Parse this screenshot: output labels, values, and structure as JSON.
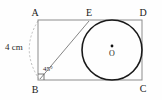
{
  "figure": {
    "background_color": "#fefefe",
    "rectangle": {
      "stroke_color": "#8c8c8c",
      "stroke_width": 1,
      "x": 38,
      "y": 20,
      "width": 104,
      "height": 60
    },
    "circle": {
      "stroke_color": "#1a1a1a",
      "stroke_width": 1.6,
      "fill": "none",
      "cx": 112,
      "cy": 50,
      "r": 30
    },
    "center_dot": {
      "cx": 112,
      "cy": 46,
      "r": 1.4,
      "color": "#111111"
    },
    "diagonal_line": {
      "stroke_color": "#777777",
      "stroke_width": 0.9,
      "x1": 40,
      "y1": 79,
      "x2": 89,
      "y2": 21
    },
    "dashed_arc": {
      "stroke_color": "#b4b4b4",
      "stroke_width": 0.9,
      "dash": "2,2",
      "from_x": 38,
      "from_y": 21,
      "to_x": 39,
      "to_y": 79,
      "bulge_x": 20,
      "bulge_y": 50
    },
    "right_angle_marker": {
      "stroke_color": "#555555",
      "size": 6
    },
    "labels": {
      "vertex_a": "A",
      "vertex_b": "B",
      "vertex_c": "C",
      "vertex_d": "D",
      "vertex_e": "E",
      "center_o": "O",
      "side_measure": "4 cm",
      "angle_measure": "45°"
    },
    "label_positions": {
      "vertex_a": {
        "x": 35,
        "y": 16
      },
      "vertex_b": {
        "x": 35,
        "y": 93
      },
      "vertex_c": {
        "x": 143,
        "y": 92
      },
      "vertex_d": {
        "x": 143,
        "y": 16
      },
      "vertex_e": {
        "x": 89,
        "y": 16
      },
      "center_o": {
        "x": 112,
        "y": 56
      },
      "side_measure": {
        "x": 5,
        "y": 50
      },
      "angle_measure": {
        "x": 43,
        "y": 71
      }
    }
  }
}
